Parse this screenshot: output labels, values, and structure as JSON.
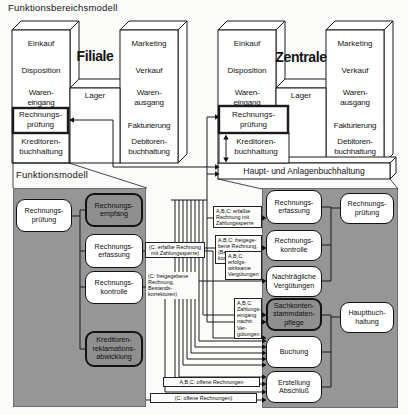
{
  "titles": {
    "top": "Funktionsbereichsmodell",
    "bottom": "Funktionsmodell"
  },
  "colors": {
    "panel_gray": "#969696",
    "box_gray": "#8f8f8f",
    "line": "#1a1a1a",
    "background": "#fbfbf9"
  },
  "filiale": {
    "name": "Filiale",
    "einkauf": "Einkauf",
    "disposition": "Disposition",
    "wareneingang": "Waren-\neingang",
    "rechnungspruefung": "Rechnungs-\nprüfung",
    "kreditorenbuchhaltung": "Kreditoren-\nbuchhaltung",
    "lager": "Lager",
    "marketing": "Marketing",
    "verkauf": "Verkauf",
    "warenausgang": "Waren-\nausgang",
    "fakturierung": "Fakturierung",
    "debitorenbuchhaltung": "Debitoren-\nbuchhaltung"
  },
  "zentrale": {
    "name": "Zentrale",
    "einkauf": "Einkauf",
    "disposition": "Disposition",
    "wareneingang": "Waren-\neingang",
    "rechnungspruefung": "Rechnungs-\nprüfung",
    "kreditorenbuchhaltung": "Kreditoren-\nbuchhaltung",
    "lager": "Lager",
    "marketing": "Marketing",
    "verkauf": "Verkauf",
    "warenausgang": "Waren-\nausgang",
    "fakturierung": "Fakturierung",
    "debitorenbuchhaltung": "Debitoren-\nbuchhaltung",
    "bar": "Haupt- und Anlagenbuchhaltung"
  },
  "left_panel": {
    "boxes": [
      {
        "label": "Rechnungs-\nprüfung"
      },
      {
        "label": "Rechnungs-\nempfang"
      },
      {
        "label": "Rechnungs-\nerfassung"
      },
      {
        "label": "Rechnungs-\nkontrolle"
      },
      {
        "label": "Kreditoren-\nreklamations-\nabwicklung"
      }
    ]
  },
  "right_panel": {
    "boxes": [
      {
        "label": "Rechnungs-\nerfassung"
      },
      {
        "label": "Rechnungs-\nkontrolle"
      },
      {
        "label": "Nachträgliche\nVergütungen"
      },
      {
        "label": "Sachkonten-\nstammdaten-\npflege"
      },
      {
        "label": "Buchung"
      },
      {
        "label": "Erstellung\nAbschluß"
      },
      {
        "label": "Rechnungs-\nprüfung"
      },
      {
        "label": "Hauptbuch-\nhaltung"
      }
    ]
  },
  "annotations": {
    "left1": "(C: erfaßte Rechnung\nmit Zahlungssperre)",
    "left2": "(C: freigegebene\nRechnung,\nBestands-\nkorrekturen)",
    "mid1": "A,B,C: erfaßte\nRechnung mit\nZahlungssperre",
    "mid2": "A,B,C: freigege-\nbene Rechnung,\n(Bestands-\nkorrekturen)",
    "mid3": "A,B,C: erfolgs-\nwirksame\nVergütungen",
    "mid4": "A,B,C:\nZahlungs-\neingang\nnachtr. Ver-\ngütungen",
    "bottom1": "A,B,C: offene Rechnungen",
    "bottom2": "(C: offene Rechnungen)"
  }
}
